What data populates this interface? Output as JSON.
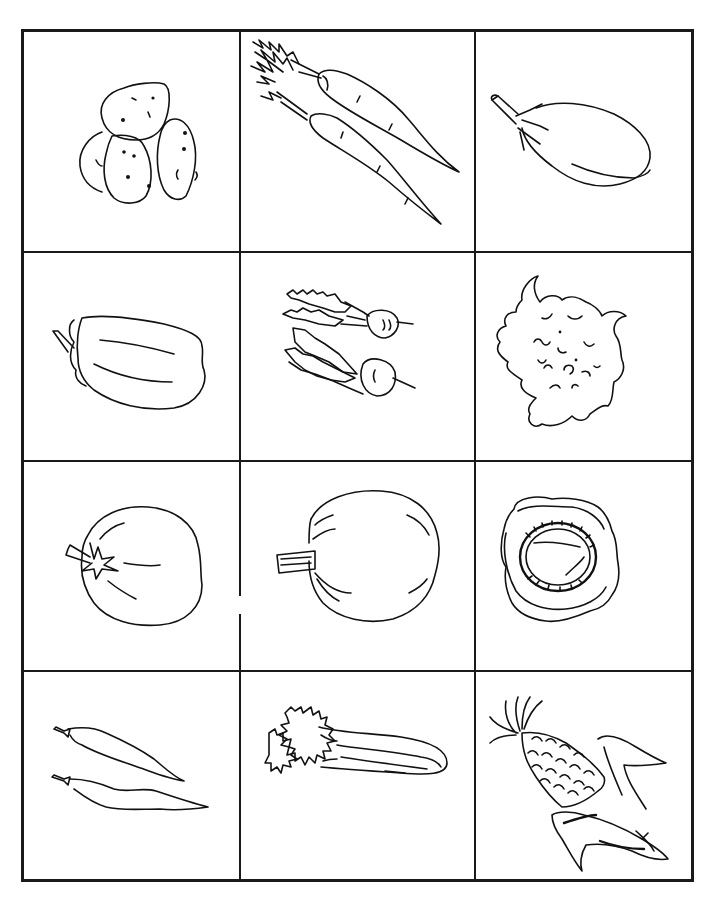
{
  "worksheet": {
    "type": "vegetable picture grid",
    "rows": 4,
    "columns": 3,
    "line_color": "#1a1a1a",
    "background": "#ffffff",
    "cells": [
      {
        "row": 1,
        "col": 1,
        "label": "potatoes",
        "icon": "potatoes-icon"
      },
      {
        "row": 1,
        "col": 2,
        "label": "carrots",
        "icon": "carrots-icon"
      },
      {
        "row": 1,
        "col": 3,
        "label": "eggplant",
        "icon": "eggplant-icon"
      },
      {
        "row": 2,
        "col": 1,
        "label": "bell pepper",
        "icon": "bell-pepper-icon"
      },
      {
        "row": 2,
        "col": 2,
        "label": "radishes",
        "icon": "radishes-icon"
      },
      {
        "row": 2,
        "col": 3,
        "label": "cauliflower",
        "icon": "cauliflower-icon"
      },
      {
        "row": 3,
        "col": 1,
        "label": "tomato",
        "icon": "tomato-icon"
      },
      {
        "row": 3,
        "col": 2,
        "label": "pumpkin",
        "icon": "pumpkin-icon"
      },
      {
        "row": 3,
        "col": 3,
        "label": "cabbage",
        "icon": "cabbage-icon"
      },
      {
        "row": 4,
        "col": 1,
        "label": "green beans",
        "icon": "green-beans-icon"
      },
      {
        "row": 4,
        "col": 2,
        "label": "celery",
        "icon": "celery-icon"
      },
      {
        "row": 4,
        "col": 3,
        "label": "corn",
        "icon": "corn-icon"
      }
    ]
  }
}
